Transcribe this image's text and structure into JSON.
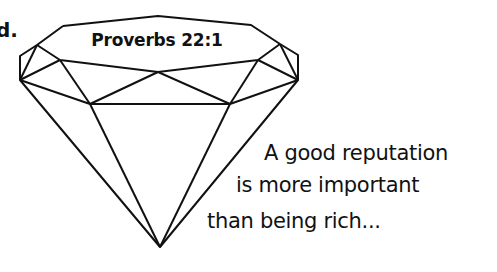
{
  "fragment": "d.",
  "diamond": {
    "label": "Proverbs 22:1",
    "stroke": "#111111"
  },
  "caption": {
    "lines": [
      "A good reputation",
      "is more important",
      "than being rich..."
    ]
  }
}
